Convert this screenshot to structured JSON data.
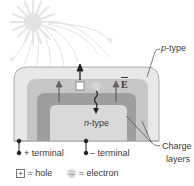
{
  "diagram": {
    "labels": {
      "p_type": "p-type",
      "n_type": "n-type",
      "charge_layers_line1": "Charge",
      "charge_layers_line2": "layers",
      "field": "E",
      "plus_terminal": "+ terminal",
      "minus_terminal": "– terminal"
    },
    "carriers": {
      "hole_symbol": "+",
      "electron_symbol": "–"
    },
    "legend": {
      "hole_symbol": "+",
      "hole_text": "= hole",
      "electron_symbol": "–",
      "electron_text": "= electron"
    },
    "colors": {
      "p_layer": "#e8e8e8",
      "charge_outer": "#c6c6c6",
      "charge_inner": "#9e9e9e",
      "n_layer": "#d9d9d9",
      "sun": "#dcdcdc",
      "arrow": "#555555"
    }
  }
}
